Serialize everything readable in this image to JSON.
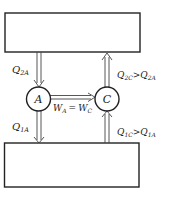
{
  "diagram": {
    "top_reservoir": {
      "label": ""
    },
    "bottom_reservoir": {
      "label": ""
    },
    "engine_a": {
      "label": "A"
    },
    "engine_c": {
      "label": "C"
    },
    "q2a": {
      "main": "Q",
      "sub": "2A"
    },
    "q1a": {
      "main": "Q",
      "sub": "1A"
    },
    "q2c": {
      "main": "Q",
      "sub": "2C",
      "rel": ">",
      "main2": "Q",
      "sub2": "2A"
    },
    "q1c": {
      "main": "Q",
      "sub": "1C",
      "rel": ">",
      "main2": "Q",
      "sub2": "1A"
    },
    "work": {
      "main": "W",
      "sub": "A",
      "eq": "=",
      "main2": "W",
      "sub2": "C"
    },
    "colors": {
      "stroke": "#222222",
      "background": "#ffffff"
    }
  }
}
